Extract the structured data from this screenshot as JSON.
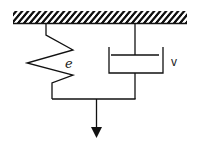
{
  "diagram": {
    "type": "kelvin-voigt-model",
    "components": [
      {
        "id": "ground",
        "kind": "fixed-support-hatched"
      },
      {
        "id": "spring",
        "kind": "spring",
        "label": "e"
      },
      {
        "id": "dashpot",
        "kind": "dashpot",
        "label": "v"
      },
      {
        "id": "load-arrow",
        "kind": "arrow-down"
      }
    ],
    "labels": {
      "spring": "e",
      "dashpot": "v"
    },
    "colors": {
      "stroke": "#111111",
      "background": "#ffffff"
    }
  }
}
